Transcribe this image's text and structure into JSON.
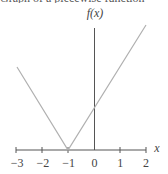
{
  "title": "Graph of a piecewise function",
  "chart_data": {
    "type": "line",
    "title": "Graph of a piecewise function",
    "xlabel": "x",
    "ylabel": "f(x)",
    "function": "f(x) = |x + 1|",
    "xlim": [
      -3,
      2
    ],
    "x_ticks": [
      -3,
      -2,
      -1,
      0,
      1,
      2
    ],
    "tick_labels": [
      "−3",
      "−2",
      "−1",
      "0",
      "1",
      "2"
    ],
    "series": [
      {
        "name": "f(x)",
        "x": [
          -3,
          -1,
          2
        ],
        "y": [
          2,
          0,
          3
        ]
      }
    ],
    "grid": false,
    "legend": null
  },
  "colors": {
    "axis": "#555555",
    "line": "#b0b0b0",
    "text": "#444444"
  }
}
